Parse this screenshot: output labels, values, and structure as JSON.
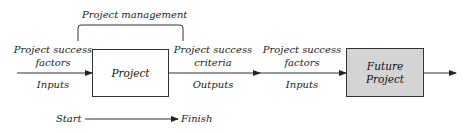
{
  "diagram": {
    "bracket_label": "Project management",
    "project_box": {
      "label": "Project",
      "fill": "#ffffff"
    },
    "future_box": {
      "label_line1": "Future",
      "label_line2": "Project",
      "fill": "#d4d4d4"
    },
    "left_input": {
      "line1": "Project success",
      "line2": "factors",
      "below": "Inputs"
    },
    "middle_output": {
      "line1": "Project success",
      "line2": "criteria",
      "below": "Outputs"
    },
    "right_input": {
      "line1": "Project success",
      "line2": "factors",
      "below": "Inputs"
    },
    "timeline": {
      "start": "Start",
      "finish": "Finish"
    },
    "colors": {
      "line": "#333333",
      "text": "#222222"
    }
  }
}
